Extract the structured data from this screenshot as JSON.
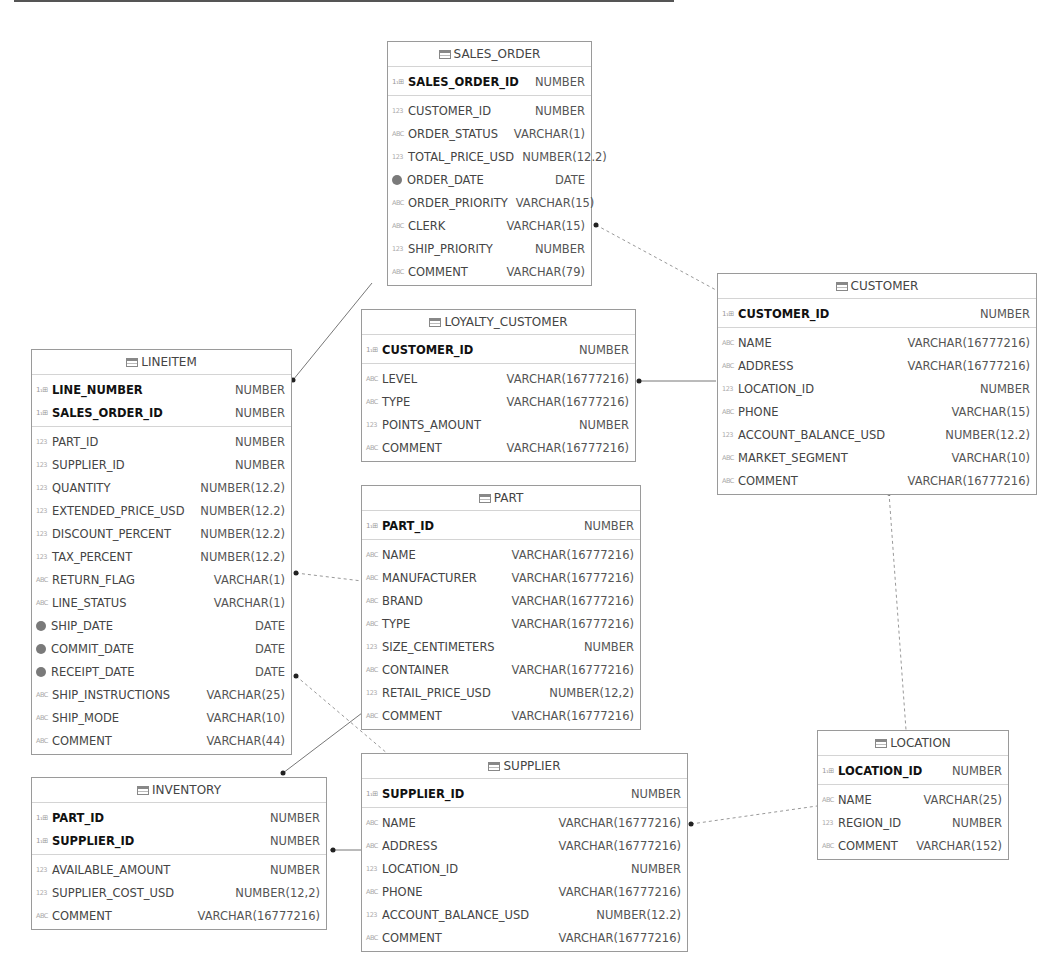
{
  "entities": {
    "sales_order": {
      "title": "SALES_ORDER",
      "pk": [
        {
          "icon": "key",
          "name": "SALES_ORDER_ID",
          "type": "NUMBER"
        }
      ],
      "cols": [
        {
          "icon": "num",
          "name": "CUSTOMER_ID",
          "type": "NUMBER"
        },
        {
          "icon": "str",
          "name": "ORDER_STATUS",
          "type": "VARCHAR(1)"
        },
        {
          "icon": "num",
          "name": "TOTAL_PRICE_USD",
          "type": "NUMBER(12.2)"
        },
        {
          "icon": "date",
          "name": "ORDER_DATE",
          "type": "DATE"
        },
        {
          "icon": "str",
          "name": "ORDER_PRIORITY",
          "type": "VARCHAR(15)"
        },
        {
          "icon": "str",
          "name": "CLERK",
          "type": "VARCHAR(15)"
        },
        {
          "icon": "num",
          "name": "SHIP_PRIORITY",
          "type": "NUMBER"
        },
        {
          "icon": "str",
          "name": "COMMENT",
          "type": "VARCHAR(79)"
        }
      ]
    },
    "lineitem": {
      "title": "LINEITEM",
      "pk": [
        {
          "icon": "key",
          "name": "LINE_NUMBER",
          "type": "NUMBER"
        },
        {
          "icon": "key",
          "name": "SALES_ORDER_ID",
          "type": "NUMBER"
        }
      ],
      "cols": [
        {
          "icon": "num",
          "name": "PART_ID",
          "type": "NUMBER"
        },
        {
          "icon": "num",
          "name": "SUPPLIER_ID",
          "type": "NUMBER"
        },
        {
          "icon": "num",
          "name": "QUANTITY",
          "type": "NUMBER(12.2)"
        },
        {
          "icon": "num",
          "name": "EXTENDED_PRICE_USD",
          "type": "NUMBER(12.2)"
        },
        {
          "icon": "num",
          "name": "DISCOUNT_PERCENT",
          "type": "NUMBER(12.2)"
        },
        {
          "icon": "num",
          "name": "TAX_PERCENT",
          "type": "NUMBER(12.2)"
        },
        {
          "icon": "str",
          "name": "RETURN_FLAG",
          "type": "VARCHAR(1)"
        },
        {
          "icon": "str",
          "name": "LINE_STATUS",
          "type": "VARCHAR(1)"
        },
        {
          "icon": "date",
          "name": "SHIP_DATE",
          "type": "DATE"
        },
        {
          "icon": "date",
          "name": "COMMIT_DATE",
          "type": "DATE"
        },
        {
          "icon": "date",
          "name": "RECEIPT_DATE",
          "type": "DATE"
        },
        {
          "icon": "str",
          "name": "SHIP_INSTRUCTIONS",
          "type": "VARCHAR(25)"
        },
        {
          "icon": "str",
          "name": "SHIP_MODE",
          "type": "VARCHAR(10)"
        },
        {
          "icon": "str",
          "name": "COMMENT",
          "type": "VARCHAR(44)"
        }
      ]
    },
    "loyalty_customer": {
      "title": "LOYALTY_CUSTOMER",
      "pk": [
        {
          "icon": "key",
          "name": "CUSTOMER_ID",
          "type": "NUMBER"
        }
      ],
      "cols": [
        {
          "icon": "str",
          "name": "LEVEL",
          "type": "VARCHAR(16777216)"
        },
        {
          "icon": "str",
          "name": "TYPE",
          "type": "VARCHAR(16777216)"
        },
        {
          "icon": "num",
          "name": "POINTS_AMOUNT",
          "type": "NUMBER"
        },
        {
          "icon": "str",
          "name": "COMMENT",
          "type": "VARCHAR(16777216)"
        }
      ]
    },
    "customer": {
      "title": "CUSTOMER",
      "pk": [
        {
          "icon": "key",
          "name": "CUSTOMER_ID",
          "type": "NUMBER"
        }
      ],
      "cols": [
        {
          "icon": "str",
          "name": "NAME",
          "type": "VARCHAR(16777216)"
        },
        {
          "icon": "str",
          "name": "ADDRESS",
          "type": "VARCHAR(16777216)"
        },
        {
          "icon": "num",
          "name": "LOCATION_ID",
          "type": "NUMBER"
        },
        {
          "icon": "str",
          "name": "PHONE",
          "type": "VARCHAR(15)"
        },
        {
          "icon": "num",
          "name": "ACCOUNT_BALANCE_USD",
          "type": "NUMBER(12.2)"
        },
        {
          "icon": "str",
          "name": "MARKET_SEGMENT",
          "type": "VARCHAR(10)"
        },
        {
          "icon": "str",
          "name": "COMMENT",
          "type": "VARCHAR(16777216)"
        }
      ]
    },
    "part": {
      "title": "PART",
      "pk": [
        {
          "icon": "key",
          "name": "PART_ID",
          "type": "NUMBER"
        }
      ],
      "cols": [
        {
          "icon": "str",
          "name": "NAME",
          "type": "VARCHAR(16777216)"
        },
        {
          "icon": "str",
          "name": "MANUFACTURER",
          "type": "VARCHAR(16777216)"
        },
        {
          "icon": "str",
          "name": "BRAND",
          "type": "VARCHAR(16777216)"
        },
        {
          "icon": "str",
          "name": "TYPE",
          "type": "VARCHAR(16777216)"
        },
        {
          "icon": "num",
          "name": "SIZE_CENTIMETERS",
          "type": "NUMBER"
        },
        {
          "icon": "str",
          "name": "CONTAINER",
          "type": "VARCHAR(16777216)"
        },
        {
          "icon": "num",
          "name": "RETAIL_PRICE_USD",
          "type": "NUMBER(12,2)"
        },
        {
          "icon": "str",
          "name": "COMMENT",
          "type": "VARCHAR(16777216)"
        }
      ]
    },
    "location": {
      "title": "LOCATION",
      "pk": [
        {
          "icon": "key",
          "name": "LOCATION_ID",
          "type": "NUMBER"
        }
      ],
      "cols": [
        {
          "icon": "str",
          "name": "NAME",
          "type": "VARCHAR(25)"
        },
        {
          "icon": "num",
          "name": "REGION_ID",
          "type": "NUMBER"
        },
        {
          "icon": "str",
          "name": "COMMENT",
          "type": "VARCHAR(152)"
        }
      ]
    },
    "inventory": {
      "title": "INVENTORY",
      "pk": [
        {
          "icon": "key",
          "name": "PART_ID",
          "type": "NUMBER"
        },
        {
          "icon": "key",
          "name": "SUPPLIER_ID",
          "type": "NUMBER"
        }
      ],
      "cols": [
        {
          "icon": "num",
          "name": "AVAILABLE_AMOUNT",
          "type": "NUMBER"
        },
        {
          "icon": "num",
          "name": "SUPPLIER_COST_USD",
          "type": "NUMBER(12,2)"
        },
        {
          "icon": "str",
          "name": "COMMENT",
          "type": "VARCHAR(16777216)"
        }
      ]
    },
    "supplier": {
      "title": "SUPPLIER",
      "pk": [
        {
          "icon": "key",
          "name": "SUPPLIER_ID",
          "type": "NUMBER"
        }
      ],
      "cols": [
        {
          "icon": "str",
          "name": "NAME",
          "type": "VARCHAR(16777216)"
        },
        {
          "icon": "str",
          "name": "ADDRESS",
          "type": "VARCHAR(16777216)"
        },
        {
          "icon": "num",
          "name": "LOCATION_ID",
          "type": "NUMBER"
        },
        {
          "icon": "str",
          "name": "PHONE",
          "type": "VARCHAR(16777216)"
        },
        {
          "icon": "num",
          "name": "ACCOUNT_BALANCE_USD",
          "type": "NUMBER(12.2)"
        },
        {
          "icon": "str",
          "name": "COMMENT",
          "type": "VARCHAR(16777216)"
        }
      ]
    }
  },
  "icons": {
    "key": "1₁⊞",
    "num": "123",
    "str": "ABC"
  },
  "colors": {
    "border": "#9a9a9a",
    "divider": "#d4d4d4",
    "link": "#777777"
  }
}
